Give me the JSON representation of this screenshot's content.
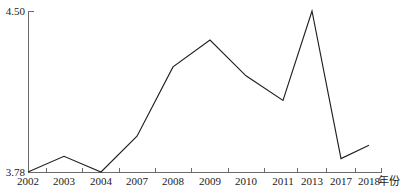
{
  "chart_data": {
    "type": "line",
    "title": "",
    "subtitle": "",
    "xlabel": "年份",
    "ylabel": "",
    "categories": [
      "2002",
      "2003",
      "2004",
      "2007",
      "2008",
      "2009",
      "2010",
      "2011",
      "2013",
      "2017",
      "2018"
    ],
    "x": [
      2002,
      2003,
      2004,
      2007,
      2008,
      2009,
      2010,
      2011,
      2013,
      2017,
      2018
    ],
    "values": [
      3.78,
      3.85,
      3.78,
      3.94,
      4.25,
      4.37,
      4.21,
      4.1,
      4.5,
      3.84,
      3.9
    ],
    "series": [
      {
        "name": "",
        "values": [
          3.78,
          3.85,
          3.78,
          3.94,
          4.25,
          4.37,
          4.21,
          4.1,
          4.5,
          3.84,
          3.9
        ]
      }
    ],
    "ylim": [
      3.78,
      4.5
    ],
    "y_tick_labels": [
      "3.78",
      "4.50"
    ],
    "y_tick_values": [
      3.78,
      4.5
    ],
    "x_tick_labels": [
      "2002",
      "2003",
      "2004",
      "2007",
      "2008",
      "2009",
      "2010",
      "2011",
      "2013",
      "2017",
      "2018"
    ],
    "grid": false,
    "legend": false,
    "legend_position": "none",
    "line_color": "#231f20",
    "axis_color": "#6b6b6b",
    "background_color": "#ffffff",
    "annotations": []
  },
  "axes": {
    "y_max_label": "4.50",
    "y_min_label": "3.78",
    "x_axis_title": "年份"
  },
  "x_labels": [
    {
      "text": "2002",
      "px": 28
    },
    {
      "text": "2003",
      "px": 64
    },
    {
      "text": "2004",
      "px": 101
    },
    {
      "text": "2007",
      "px": 137
    },
    {
      "text": "2008",
      "px": 173
    },
    {
      "text": "2009",
      "px": 210
    },
    {
      "text": "2010",
      "px": 246
    },
    {
      "text": "2011",
      "px": 283
    },
    {
      "text": "2013",
      "px": 312
    },
    {
      "text": "2017",
      "px": 341
    },
    {
      "text": "2018",
      "px": 369
    }
  ]
}
